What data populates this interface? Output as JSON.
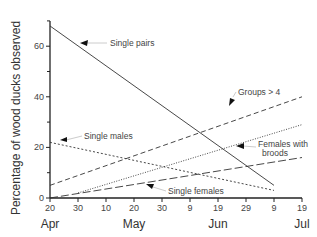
{
  "chart_data": {
    "type": "line",
    "title": "",
    "xlabel": "",
    "ylabel": "Percentage of wood ducks observed",
    "ylim": [
      0,
      70
    ],
    "yticks": [
      0,
      20,
      40,
      60
    ],
    "yminor": [
      10,
      30,
      50
    ],
    "xticks": [
      "20",
      "30",
      "10",
      "20",
      "30",
      "9",
      "19",
      "29",
      "9",
      "19"
    ],
    "months": [
      {
        "label": "Apr",
        "tick_index": 0
      },
      {
        "label": "May",
        "tick_index": 3
      },
      {
        "label": "Jun",
        "tick_index": 6
      },
      {
        "label": "Jul",
        "tick_index": 9
      }
    ],
    "grid": false,
    "series": [
      {
        "name": "Single pairs",
        "style": "solid",
        "x_index": [
          0,
          8
        ],
        "values": [
          68,
          5
        ]
      },
      {
        "name": "Groups > 4",
        "style": "dashed",
        "x_index": [
          0,
          9
        ],
        "values": [
          5,
          40
        ]
      },
      {
        "name": "Single males",
        "style": "dotted-dash",
        "x_index": [
          0,
          8
        ],
        "values": [
          22,
          3
        ]
      },
      {
        "name": "Females with broods",
        "style": "dotted",
        "x_index": [
          1,
          9
        ],
        "values": [
          2,
          29
        ]
      },
      {
        "name": "Single females",
        "style": "long-dash",
        "x_index": [
          0,
          9
        ],
        "values": [
          0,
          16
        ]
      }
    ],
    "annotations": [
      {
        "text": "Single pairs",
        "series": "Single pairs"
      },
      {
        "text": "Groups > 4",
        "series": "Groups > 4"
      },
      {
        "text": "Single males",
        "series": "Single males"
      },
      {
        "text": "Females with",
        "text2": "broods",
        "series": "Females with broods"
      },
      {
        "text": "Single females",
        "series": "Single females"
      }
    ]
  }
}
